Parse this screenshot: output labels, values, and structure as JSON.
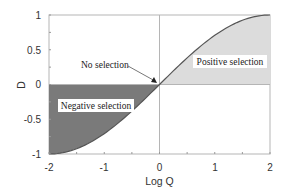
{
  "chart_data": {
    "type": "area",
    "title": "",
    "xlabel": "Log Q",
    "ylabel": "D",
    "xlim": [
      -2,
      2
    ],
    "ylim": [
      -1,
      1
    ],
    "xticks": [
      -2,
      -1,
      0,
      1,
      2
    ],
    "xtick_labels": [
      "-2",
      "-1",
      "0",
      "1",
      "2"
    ],
    "yticks": [
      -1,
      -0.5,
      0,
      0.5,
      1
    ],
    "ytick_labels": [
      "-1",
      "-0.5",
      "0",
      "0.5",
      "1"
    ],
    "grid": false,
    "legend": null,
    "series": [
      {
        "name": "D vs Log Q",
        "x": [
          -2,
          -1.75,
          -1.5,
          -1.25,
          -1,
          -0.75,
          -0.5,
          -0.25,
          0,
          0.25,
          0.5,
          0.75,
          1,
          1.25,
          1.5,
          1.75,
          2
        ],
        "y": [
          -1,
          -0.98,
          -0.92,
          -0.83,
          -0.71,
          -0.56,
          -0.38,
          -0.2,
          0,
          0.2,
          0.38,
          0.56,
          0.71,
          0.83,
          0.92,
          0.98,
          1
        ]
      }
    ],
    "regions": [
      {
        "name": "Negative selection",
        "x_range": [
          -2,
          0
        ],
        "fill": "#7a7a7a"
      },
      {
        "name": "Positive selection",
        "x_range": [
          0,
          2
        ],
        "fill": "#dcdcdc"
      }
    ],
    "annotations": [
      {
        "text": "No selection",
        "arrow_to": [
          0,
          0
        ]
      },
      {
        "text": "Positive selection",
        "x": 1.15,
        "y": 0.35
      },
      {
        "text": "Negative selection",
        "x": -1.35,
        "y": -0.25
      }
    ],
    "reference_lines": [
      {
        "orientation": "vertical",
        "value": 0
      },
      {
        "orientation": "horizontal",
        "value": 0
      }
    ]
  },
  "labels": {
    "xlabel": "Log Q",
    "ylabel": "D",
    "no_selection": "No selection",
    "positive": "Positive selection",
    "negative": "Negative selection",
    "xticks": [
      "-2",
      "-1",
      "0",
      "1",
      "2"
    ],
    "yticks": [
      "1",
      "0.5",
      "0",
      "-0.5",
      "-1"
    ]
  },
  "colors": {
    "negative_fill": "#7a7a7a",
    "positive_fill": "#dcdcdc",
    "curve": "#555555",
    "axis": "#999999"
  }
}
